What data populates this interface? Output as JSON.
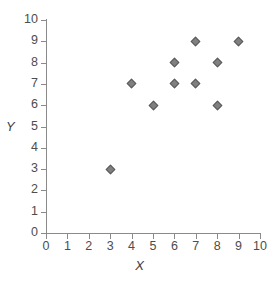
{
  "chart_data": {
    "type": "scatter",
    "title": "",
    "xlabel": "X",
    "ylabel": "Y",
    "xlim": [
      0,
      10
    ],
    "ylim": [
      0,
      10
    ],
    "xticks": [
      0,
      1,
      2,
      3,
      4,
      5,
      6,
      7,
      8,
      9,
      10
    ],
    "yticks": [
      0,
      1,
      2,
      3,
      4,
      5,
      6,
      7,
      8,
      9,
      10
    ],
    "grid": false,
    "legend": false,
    "marker": "diamond",
    "marker_color": "#808080",
    "marker_edge_color": "#5a5a5a",
    "axis_color": "#8a8a8a",
    "text_color": "#4d4d4d",
    "background": "#ffffff",
    "points": [
      {
        "x": 3,
        "y": 3
      },
      {
        "x": 4,
        "y": 7
      },
      {
        "x": 5,
        "y": 6
      },
      {
        "x": 6,
        "y": 7
      },
      {
        "x": 6,
        "y": 8
      },
      {
        "x": 7,
        "y": 7
      },
      {
        "x": 7,
        "y": 9
      },
      {
        "x": 8,
        "y": 6
      },
      {
        "x": 8,
        "y": 8
      },
      {
        "x": 9,
        "y": 9
      }
    ],
    "x": [
      3,
      4,
      5,
      6,
      6,
      7,
      7,
      8,
      8,
      9
    ],
    "y": [
      3,
      7,
      6,
      7,
      8,
      7,
      9,
      6,
      8,
      9
    ]
  }
}
